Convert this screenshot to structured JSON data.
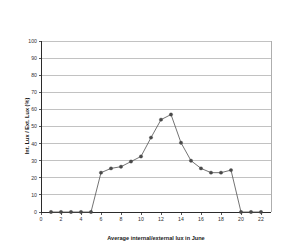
{
  "chart_data": {
    "type": "line",
    "title": "",
    "xlabel": "Average internal/external lux in June",
    "ylabel": "Int. Lux / Ext. Lux (%)",
    "xlim": [
      0,
      23
    ],
    "ylim": [
      0,
      100
    ],
    "grid": true,
    "legend": "none",
    "marker": "filled-circle",
    "line_color": "#5a5a5a",
    "marker_color": "#4a4a4a",
    "grid_color": "#9a9a9a",
    "axis_color": "#2b2b2b",
    "background": "#ffffff",
    "x_ticks": [
      0,
      2,
      4,
      6,
      8,
      10,
      12,
      14,
      16,
      18,
      20,
      22
    ],
    "x_tick_labels": [
      "0",
      "2",
      "4",
      "6",
      "8",
      "10",
      "12",
      "14",
      "16",
      "18",
      "20",
      "22"
    ],
    "y_ticks": [
      0,
      10,
      20,
      30,
      40,
      50,
      60,
      70,
      80,
      90,
      100
    ],
    "y_tick_labels": [
      "0",
      "10",
      "20",
      "30",
      "40",
      "50",
      "60",
      "70",
      "80",
      "90",
      "100"
    ],
    "x": [
      1,
      2,
      3,
      4,
      5,
      6,
      7,
      8,
      9,
      10,
      11,
      12,
      13,
      14,
      15,
      16,
      17,
      18,
      19,
      20,
      21,
      22
    ],
    "values": [
      0,
      0,
      0,
      0,
      0,
      23,
      25.5,
      26.5,
      29.5,
      32.5,
      43.5,
      54,
      57,
      40.5,
      30,
      25.5,
      23,
      23,
      24.5,
      0,
      0,
      0
    ],
    "series": [
      {
        "name": "Average internal/external lux in June",
        "values": [
          0,
          0,
          0,
          0,
          0,
          23,
          25.5,
          26.5,
          29.5,
          32.5,
          43.5,
          54,
          57,
          40.5,
          30,
          25.5,
          23,
          23,
          24.5,
          0,
          0,
          0
        ]
      }
    ]
  }
}
